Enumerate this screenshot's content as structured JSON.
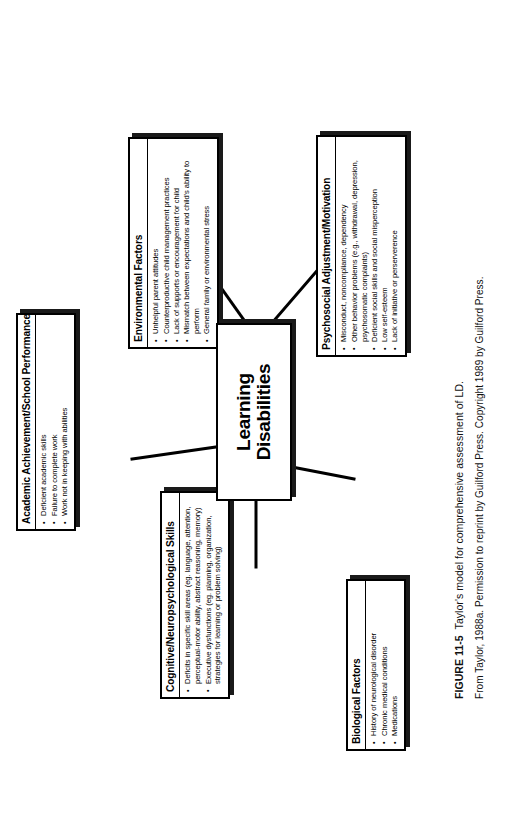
{
  "figure": {
    "number": "FIGURE 11-5",
    "caption": "Taylor's model for comprehensive assessment of LD.",
    "source": "From Taylor, 1988a. Permission to reprint by Guilford Press. Copyright 1989 by Guilford Press."
  },
  "hub": {
    "line1": "Learning",
    "line2": "Disabilities"
  },
  "nodes": {
    "academic": {
      "title": "Academic Achievement/School Performance",
      "bullets": [
        "Deficient academic skills",
        "Failure to complete work",
        "Work not in keeping with abilities"
      ]
    },
    "cognitive": {
      "title": "Cognitive/Neuropsychological Skills",
      "bullets": [
        "Deficits in specific skill areas (eg. language, attention, perceptual-motor ability, abstract reasoning, memory)",
        "Executive dysfunctions (eg. planning, organization, strategies for learning or problem solving)"
      ]
    },
    "environment": {
      "title": "Environmental Factors",
      "bullets": [
        "Unhelpful parent attitudes",
        "Counterproductive child management practices",
        "Lack of supports or encouragement for child",
        "Mismatch between expectations and child's ability to perform",
        "General family or environmental stress"
      ]
    },
    "psychosocial": {
      "title": "Psychosocial Adjustment/Motivation",
      "bullets": [
        "Misconduct, noncompliance, dependency",
        "Other behavior problems (e.g., withdrawal, depression, psychosomatic complaints)",
        "Deficient social skills and social misperception",
        "Low self-esteem",
        "Lack of initiative or perserverence"
      ]
    },
    "biological": {
      "title": "Biological Factors",
      "bullets": [
        "History of neurological disorder",
        "Chronic medical conditions",
        "Medications"
      ]
    }
  },
  "colors": {
    "ink": "#000000",
    "paper": "#ffffff",
    "shadow": "#1a1a1a"
  }
}
